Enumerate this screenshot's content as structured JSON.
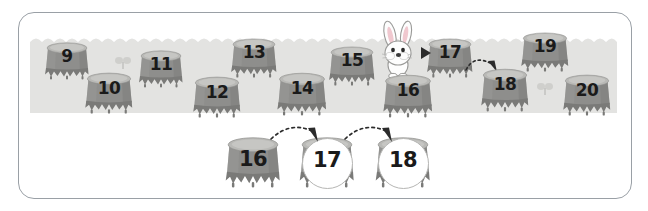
{
  "worksheet": {
    "title": "Number line stumps counting activity",
    "frame_color": "#9aa0a6",
    "ground_color": "#e3e3e1",
    "stump_body_color": "#8e8e8c",
    "stump_top_color": "#b9b9b6",
    "number_color": "#1a1a1a",
    "arrow_color": "#2b2b2b",
    "answer_circle_color": "#ffffff"
  },
  "field": {
    "name": "number-field",
    "back_row": [
      {
        "label": "9",
        "x": 42,
        "y": 40,
        "w": 50,
        "h": 40
      },
      {
        "label": "11",
        "x": 136,
        "y": 48,
        "w": 50,
        "h": 40
      },
      {
        "label": "13",
        "x": 228,
        "y": 36,
        "w": 52,
        "h": 42
      },
      {
        "label": "15",
        "x": 326,
        "y": 44,
        "w": 52,
        "h": 42
      },
      {
        "label": "17",
        "x": 424,
        "y": 36,
        "w": 52,
        "h": 42
      },
      {
        "label": "19",
        "x": 518,
        "y": 30,
        "w": 54,
        "h": 42
      }
    ],
    "front_row": [
      {
        "label": "10",
        "x": 82,
        "y": 70,
        "w": 54,
        "h": 44
      },
      {
        "label": "12",
        "x": 190,
        "y": 74,
        "w": 54,
        "h": 44
      },
      {
        "label": "14",
        "x": 274,
        "y": 70,
        "w": 56,
        "h": 46
      },
      {
        "label": "16",
        "x": 380,
        "y": 72,
        "w": 56,
        "h": 46
      },
      {
        "label": "18",
        "x": 478,
        "y": 66,
        "w": 54,
        "h": 46
      },
      {
        "label": "20",
        "x": 560,
        "y": 72,
        "w": 54,
        "h": 44
      }
    ]
  },
  "answer_row": {
    "name": "answer-row",
    "stumps": [
      {
        "label": "16",
        "filled": true,
        "x": 222,
        "y": 134,
        "w": 62,
        "h": 54
      },
      {
        "label": "17",
        "filled": false,
        "x": 296,
        "y": 134,
        "w": 62,
        "h": 54
      },
      {
        "label": "18",
        "filled": false,
        "x": 372,
        "y": 134,
        "w": 62,
        "h": 54
      }
    ],
    "arrows": [
      {
        "name": "hop-arrow-16-to-17",
        "x": 268,
        "y": 120,
        "w": 62,
        "h": 26
      },
      {
        "name": "hop-arrow-17-to-18",
        "x": 342,
        "y": 120,
        "w": 62,
        "h": 26
      }
    ]
  },
  "field_arrows": [
    {
      "name": "hop-arrow-17-to-18-field",
      "x": 464,
      "y": 52,
      "w": 40,
      "h": 26
    }
  ],
  "pointer": {
    "name": "pointer-to-17",
    "x": 420,
    "y": 46,
    "w": 12,
    "h": 14
  },
  "rabbit": {
    "name": "rabbit-character",
    "x": 374,
    "y": 20,
    "w": 48,
    "h": 60,
    "body_color": "#fdfdfd",
    "ear_inner_color": "#f0c8cf",
    "outline_color": "#8c8c8a"
  },
  "sprouts": [
    {
      "name": "sprout-decoration-1",
      "x": 114,
      "y": 56,
      "w": 18,
      "h": 14
    },
    {
      "name": "sprout-decoration-2",
      "x": 536,
      "y": 82,
      "w": 18,
      "h": 14
    }
  ]
}
